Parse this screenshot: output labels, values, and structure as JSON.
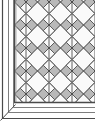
{
  "figure": {
    "name": "diagonal-tile-border-corner-diagram",
    "width": 95,
    "height": 121,
    "background_color": "#ffffff"
  },
  "colors": {
    "paper": "#ffffff",
    "field_gray": "#b9b9b9",
    "tile_white": "#fafafa",
    "outline_dark": "#3a3a3a",
    "outline_mid": "#5e5e5e",
    "border_line": "#4a4a4a",
    "border_line_light": "#8e8e8e",
    "shadow_gray": "#d4d4d4"
  },
  "field": {
    "name": "diagonal-tile-field",
    "x": 14,
    "y": 2,
    "width": 81,
    "height": 100,
    "fill": "#b9b9b9",
    "pattern": {
      "type": "diagonal-checkerboard",
      "tile_pitch": 23,
      "diamond_half_diagonal": 11.5,
      "diamond_fill": "#fafafa",
      "gap_fill": "#b9b9b9",
      "outline_color": "#3a3a3a",
      "outline_width": 1,
      "columns": 4,
      "rows": 5,
      "origin_x": 26,
      "origin_y": 2
    }
  },
  "frame": {
    "name": "field-frame-line",
    "color": "#4a4a4a",
    "width": 1,
    "left_x": 14,
    "bottom_y": 102
  },
  "borders": {
    "left": {
      "name": "left-border-band",
      "lines_x": [
        2,
        8,
        13
      ],
      "top_y": 2,
      "bottom_y": 121,
      "color": "#4a4a4a"
    },
    "bottom": {
      "name": "bottom-border-band",
      "lines_y": [
        103,
        109,
        115
      ],
      "left_x": 0,
      "right_x": 95,
      "color": "#4a4a4a"
    },
    "miter": {
      "name": "corner-miter-joint",
      "angle_degrees": 45,
      "corner_x": 0,
      "corner_y": 121,
      "color": "#4a4a4a"
    }
  },
  "labels": {
    "none_visible": ""
  }
}
